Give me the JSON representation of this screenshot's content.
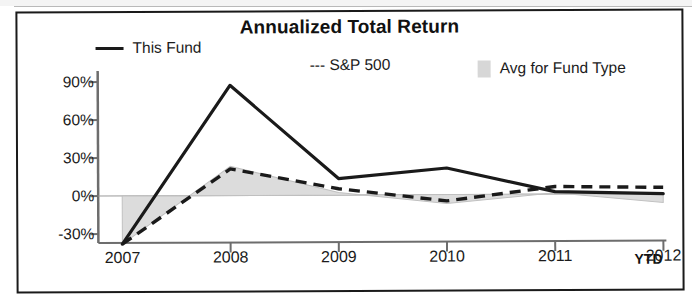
{
  "chart_data": {
    "type": "line",
    "title": "Annualized Total Return",
    "xlabel": "",
    "ylabel": "",
    "x": [
      "2007",
      "2008",
      "2009",
      "2010",
      "2011",
      "2012"
    ],
    "categories": [
      "2007",
      "2008",
      "2009",
      "2010",
      "2011",
      "2012"
    ],
    "ytick_labels": [
      "90%",
      "60%",
      "30%",
      "0%",
      "-30%"
    ],
    "ytick_values": [
      90,
      60,
      30,
      0,
      -30
    ],
    "ylim": [
      -45,
      100
    ],
    "grid": false,
    "legend_position": "top",
    "x_axis_suffix": "YTD",
    "series": [
      {
        "name": "This Fund",
        "style": "solid",
        "color": "#1a1a1a",
        "values": [
          -38,
          87,
          13,
          21,
          2,
          0
        ]
      },
      {
        "name": "S&P 500",
        "style": "dashed",
        "color": "#1a1a1a",
        "values": [
          -38,
          21,
          5,
          -5,
          6,
          5
        ]
      },
      {
        "name": "Avg for Fund Type",
        "style": "band",
        "color": "#d7d7d7",
        "values": [
          -38,
          23,
          2,
          -7,
          1,
          -7
        ]
      }
    ]
  },
  "legend": {
    "this_fund": "This Fund",
    "sp500": "--- S&P 500",
    "avg_fund_type": "Avg for Fund Type"
  }
}
